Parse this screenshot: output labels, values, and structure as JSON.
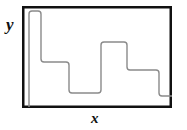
{
  "figure": {
    "background_color": "#ffffff",
    "frame": {
      "color": "#111111",
      "line_width": 2.5,
      "left": 22,
      "top": 6,
      "right": 172,
      "bottom": 108
    }
  },
  "axes": {
    "y_label": "y",
    "x_label": "x"
  },
  "chart_data": {
    "type": "line",
    "title": "",
    "xlabel": "x",
    "ylabel": "y",
    "grid": false,
    "legend": "none",
    "axis_ticks": {
      "x": [],
      "y": []
    },
    "series": [
      {
        "name": "step-curve",
        "color": "#8a8a8a",
        "line_width": 1.4,
        "corner_radius": 3,
        "plateaus": [
          {
            "x_start": 29,
            "x_end": 29,
            "y_level": 107,
            "label": "baseline-start"
          },
          {
            "x_start": 30,
            "x_end": 41,
            "y_level": 11,
            "label": "tall-pulse"
          },
          {
            "x_start": 43,
            "x_end": 69,
            "y_level": 62,
            "label": "upper-mid-plateau"
          },
          {
            "x_start": 72,
            "x_end": 101,
            "y_level": 93,
            "label": "low-plateau"
          },
          {
            "x_start": 104,
            "x_end": 127,
            "y_level": 42,
            "label": "high-plateau"
          },
          {
            "x_start": 130,
            "x_end": 159,
            "y_level": 70,
            "label": "mid-plateau"
          },
          {
            "x_start": 163,
            "x_end": 172,
            "y_level": 96,
            "label": "final-low-plateau"
          }
        ],
        "path": "M 29 107 L 29 14 Q 29 11 32 11 L 38 11 Q 41 11 41 14 L 41 59 Q 41 62 44 62 L 66 62 Q 69 62 69 65 L 69 90 Q 69 93 72 93 L 98 93 Q 101 93 101 90 L 101 45 Q 101 42 104 42 L 124 42 Q 127 42 127 45 L 127 67 Q 127 70 130 70 L 156 70 Q 159 70 159 73 L 159 93 Q 159 96 162 96 L 172 96"
      }
    ]
  }
}
